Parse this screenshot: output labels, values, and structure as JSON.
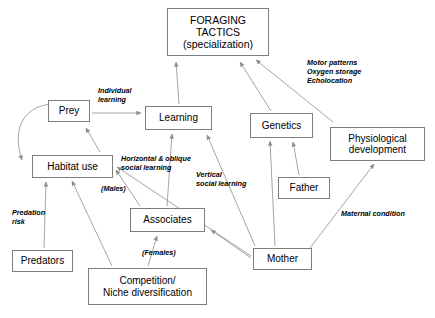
{
  "diagram": {
    "background_color": "#ffffff",
    "line_color": "#9a9a9a",
    "box_border_color": "#7d7d7d",
    "text_color": "#000000",
    "nodes": [
      {
        "id": "foraging",
        "text": "FORAGING\nTACTICS\n(specialization)"
      },
      {
        "id": "prey",
        "text": "Prey"
      },
      {
        "id": "learning",
        "text": "Learning"
      },
      {
        "id": "genetics",
        "text": "Genetics"
      },
      {
        "id": "physio",
        "text": "Physiological\ndevelopment"
      },
      {
        "id": "habitat",
        "text": "Habitat use"
      },
      {
        "id": "father",
        "text": "Father"
      },
      {
        "id": "associates",
        "text": "Associates"
      },
      {
        "id": "predators",
        "text": "Predators"
      },
      {
        "id": "mother",
        "text": "Mother"
      },
      {
        "id": "competition",
        "text": "Competition/\nNiche diversification"
      }
    ],
    "edge_labels": [
      {
        "id": "individual",
        "text": "Individual\nlearning"
      },
      {
        "id": "motor",
        "text": "Motor patterns\nOxygen storage\nEcholocation"
      },
      {
        "id": "horizontal",
        "text": "Horizontal & oblique\nsocial learning"
      },
      {
        "id": "males",
        "text": "(Males)"
      },
      {
        "id": "vertical",
        "text": "Vertical\nsocial learning"
      },
      {
        "id": "predation",
        "text": "Predation\nrisk"
      },
      {
        "id": "maternal",
        "text": "Maternal condition"
      },
      {
        "id": "females",
        "text": "(Females)"
      }
    ]
  }
}
